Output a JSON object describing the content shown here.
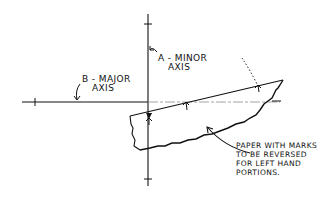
{
  "diagram": {
    "labels": {
      "minor_axis": {
        "line1": "A - MINOR",
        "line2": "AXIS"
      },
      "major_axis": {
        "line1": "B - MAJOR",
        "line2": "AXIS"
      },
      "paper_note": {
        "line1": "PAPER WITH MARKS",
        "line2": "TO BE REVERSED",
        "line3": "FOR LEFT HAND",
        "line4": "PORTIONS."
      }
    },
    "elements": [
      "vertical-minor-axis-line",
      "horizontal-major-axis-line",
      "paper-strip-with-marks",
      "dotted-rotation-arrow"
    ],
    "colors": {
      "ink": "#111111",
      "background": "#ffffff",
      "faint": "#999999"
    }
  }
}
